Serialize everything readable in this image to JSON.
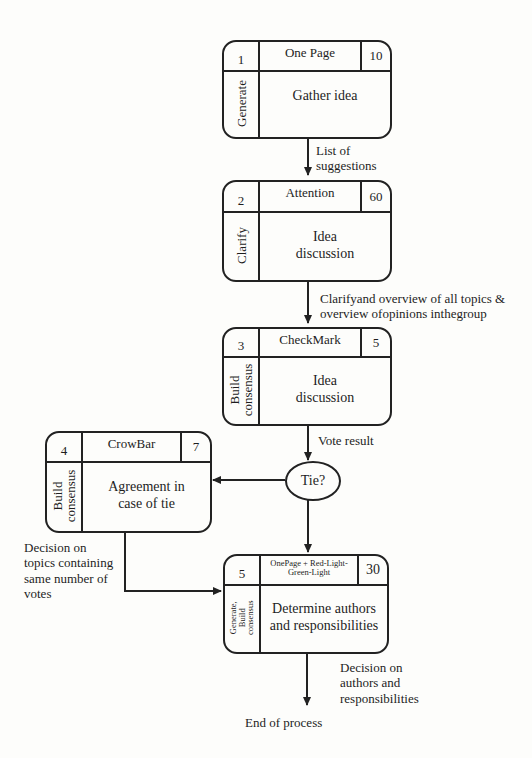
{
  "diagram": {
    "colors": {
      "line": "#222222",
      "background": "#fdfdfb",
      "text": "#1e1e1e"
    },
    "steps": [
      {
        "id": "step-1",
        "number": "1",
        "tool": "One Page",
        "duration": "10",
        "phase": "Generate",
        "activity": "Gather idea"
      },
      {
        "id": "step-2",
        "number": "2",
        "tool": "Attention",
        "duration": "60",
        "phase": "Clarify",
        "activity": "Idea discussion"
      },
      {
        "id": "step-3",
        "number": "3",
        "tool": "CheckMark",
        "duration": "5",
        "phase": "Build consensus",
        "activity": "Idea discussion"
      },
      {
        "id": "step-4",
        "number": "4",
        "tool": "CrowBar",
        "duration": "7",
        "phase": "Build consensus",
        "activity": "Agreement in case of tie"
      },
      {
        "id": "step-5",
        "number": "5",
        "tool": "OnePage +  Red-Light-Green-Light",
        "duration": "30",
        "phase": "Generate, Build consensus",
        "activity": "Determine authors and responsibilities"
      }
    ],
    "decision": {
      "label": "Tie?"
    },
    "edge_labels": {
      "e1": "List of\nsuggestions",
      "e2": "Clarifyand overview of all topics &\noverview ofopinions inthegroup",
      "e3": "Vote result",
      "e4": "Decision on\ntopics containing\nsame number of\nvotes",
      "e5": "Decision on\nauthors and\nresponsibilities"
    },
    "end_label": "End of process"
  }
}
